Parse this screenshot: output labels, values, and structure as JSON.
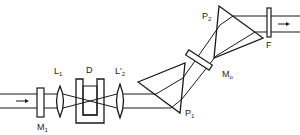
{
  "diagram": {
    "title": "",
    "type": "optical-setup",
    "components": [
      {
        "id": "M1",
        "label": "M",
        "sub": "1",
        "kind": "mirror"
      },
      {
        "id": "L1",
        "label": "L",
        "sub": "1",
        "kind": "lens"
      },
      {
        "id": "D",
        "label": "D",
        "sub": "",
        "kind": "dye-cell"
      },
      {
        "id": "L2",
        "label": "L'",
        "sub": "2",
        "kind": "lens"
      },
      {
        "id": "P1",
        "label": "P",
        "sub": "1",
        "kind": "prism"
      },
      {
        "id": "Mo",
        "label": "M",
        "sub": "o",
        "kind": "mirror"
      },
      {
        "id": "P2",
        "label": "P",
        "sub": "2",
        "kind": "prism"
      },
      {
        "id": "F",
        "label": "F",
        "sub": "",
        "kind": "filter"
      }
    ],
    "arrows": [
      {
        "id": "input-arrow",
        "direction": "right"
      },
      {
        "id": "output-arrow",
        "direction": "right"
      }
    ],
    "colors": {
      "line": "#1a1a1a",
      "background": "#ffffff"
    }
  }
}
